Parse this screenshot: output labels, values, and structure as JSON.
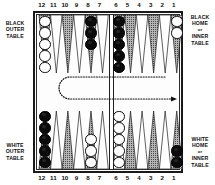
{
  "figure": {
    "kind": "backgammon-board-diagram",
    "colors": {
      "frame": "#1a1a1a",
      "point_shaded": "#8d8d8d",
      "point_white": "#ffffff",
      "point_outline": "#1d1d1d",
      "checker_white": "#ffffff",
      "checker_black": "#0b0b0b",
      "arrow": "#111111",
      "background": "#ffffff"
    }
  },
  "labels": {
    "black_outer": {
      "line1": "BLACK",
      "line2": "OUTER",
      "line3": "TABLE"
    },
    "white_outer": {
      "line1": "WHITE",
      "line2": "OUTER",
      "line3": "TABLE"
    },
    "black_home": {
      "line1": "BLACK",
      "line2": "HOME",
      "line3": "or",
      "line4": "INNER",
      "line5": "TABLE"
    },
    "white_home": {
      "line1": "WHITE",
      "line2": "HOME",
      "line3": "or",
      "line4": "INNER",
      "line5": "TABLE"
    }
  },
  "point_numbers": {
    "top": [
      "12",
      "11",
      "10",
      "9",
      "8",
      "7",
      "6",
      "5",
      "4",
      "3",
      "2",
      "1"
    ],
    "bottom": [
      "12",
      "11",
      "10",
      "9",
      "8",
      "7",
      "6",
      "5",
      "4",
      "3",
      "2",
      "1"
    ]
  },
  "points": {
    "top": [
      {
        "number": "12",
        "slot": 0,
        "shade": "shaded",
        "checkers": 5,
        "color": "white"
      },
      {
        "number": "11",
        "slot": 1,
        "shade": "white",
        "checkers": 0,
        "color": "none"
      },
      {
        "number": "10",
        "slot": 2,
        "shade": "shaded",
        "checkers": 0,
        "color": "none"
      },
      {
        "number": "9",
        "slot": 3,
        "shade": "white",
        "checkers": 0,
        "color": "none"
      },
      {
        "number": "8",
        "slot": 4,
        "shade": "shaded",
        "checkers": 3,
        "color": "black"
      },
      {
        "number": "7",
        "slot": 5,
        "shade": "white",
        "checkers": 0,
        "color": "none"
      },
      {
        "number": "6",
        "slot": 6,
        "shade": "shaded",
        "checkers": 5,
        "color": "black"
      },
      {
        "number": "5",
        "slot": 7,
        "shade": "shaded",
        "checkers": 0,
        "color": "none"
      },
      {
        "number": "4",
        "slot": 8,
        "shade": "white",
        "checkers": 0,
        "color": "none"
      },
      {
        "number": "3",
        "slot": 9,
        "shade": "shaded",
        "checkers": 0,
        "color": "none"
      },
      {
        "number": "2",
        "slot": 10,
        "shade": "white",
        "checkers": 0,
        "color": "none"
      },
      {
        "number": "1",
        "slot": 11,
        "shade": "shaded",
        "checkers": 2,
        "color": "white"
      }
    ],
    "bottom": [
      {
        "number": "12",
        "slot": 0,
        "shade": "shaded",
        "checkers": 5,
        "color": "black"
      },
      {
        "number": "11",
        "slot": 1,
        "shade": "white",
        "checkers": 0,
        "color": "none"
      },
      {
        "number": "10",
        "slot": 2,
        "shade": "shaded",
        "checkers": 0,
        "color": "none"
      },
      {
        "number": "9",
        "slot": 3,
        "shade": "white",
        "checkers": 0,
        "color": "none"
      },
      {
        "number": "8",
        "slot": 4,
        "shade": "shaded",
        "checkers": 3,
        "color": "white"
      },
      {
        "number": "7",
        "slot": 5,
        "shade": "white",
        "checkers": 0,
        "color": "none"
      },
      {
        "number": "6",
        "slot": 6,
        "shade": "white",
        "checkers": 5,
        "color": "white"
      },
      {
        "number": "5",
        "slot": 7,
        "shade": "shaded",
        "checkers": 0,
        "color": "none"
      },
      {
        "number": "4",
        "slot": 8,
        "shade": "white",
        "checkers": 0,
        "color": "none"
      },
      {
        "number": "3",
        "slot": 9,
        "shade": "shaded",
        "checkers": 0,
        "color": "none"
      },
      {
        "number": "2",
        "slot": 10,
        "shade": "white",
        "checkers": 0,
        "color": "none"
      },
      {
        "number": "1",
        "slot": 11,
        "shade": "shaded",
        "checkers": 2,
        "color": "black"
      }
    ]
  },
  "move_arrow": {
    "name": "movement-direction-arrow",
    "style": "dotted",
    "description": "U-shaped dotted path running right-to-left across the top of the bar area, turning around at the left and running left-to-right, ending in an arrowhead at the right",
    "head_direction": "right"
  }
}
